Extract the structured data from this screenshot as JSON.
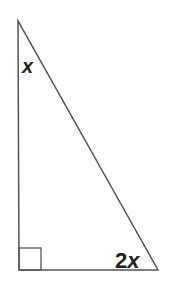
{
  "diagram": {
    "type": "right-triangle",
    "stroke_color": "#555555",
    "label_color": "#222222",
    "vertices": {
      "top": [
        18,
        21
      ],
      "right_angle": [
        19,
        270
      ],
      "bottom_right": [
        158,
        270
      ]
    },
    "angles": {
      "top": {
        "label_var": "x",
        "label_coeff": ""
      },
      "bottom_right": {
        "label_coeff": "2",
        "label_var": "x"
      },
      "right_angle": {
        "marker": "square"
      }
    }
  }
}
